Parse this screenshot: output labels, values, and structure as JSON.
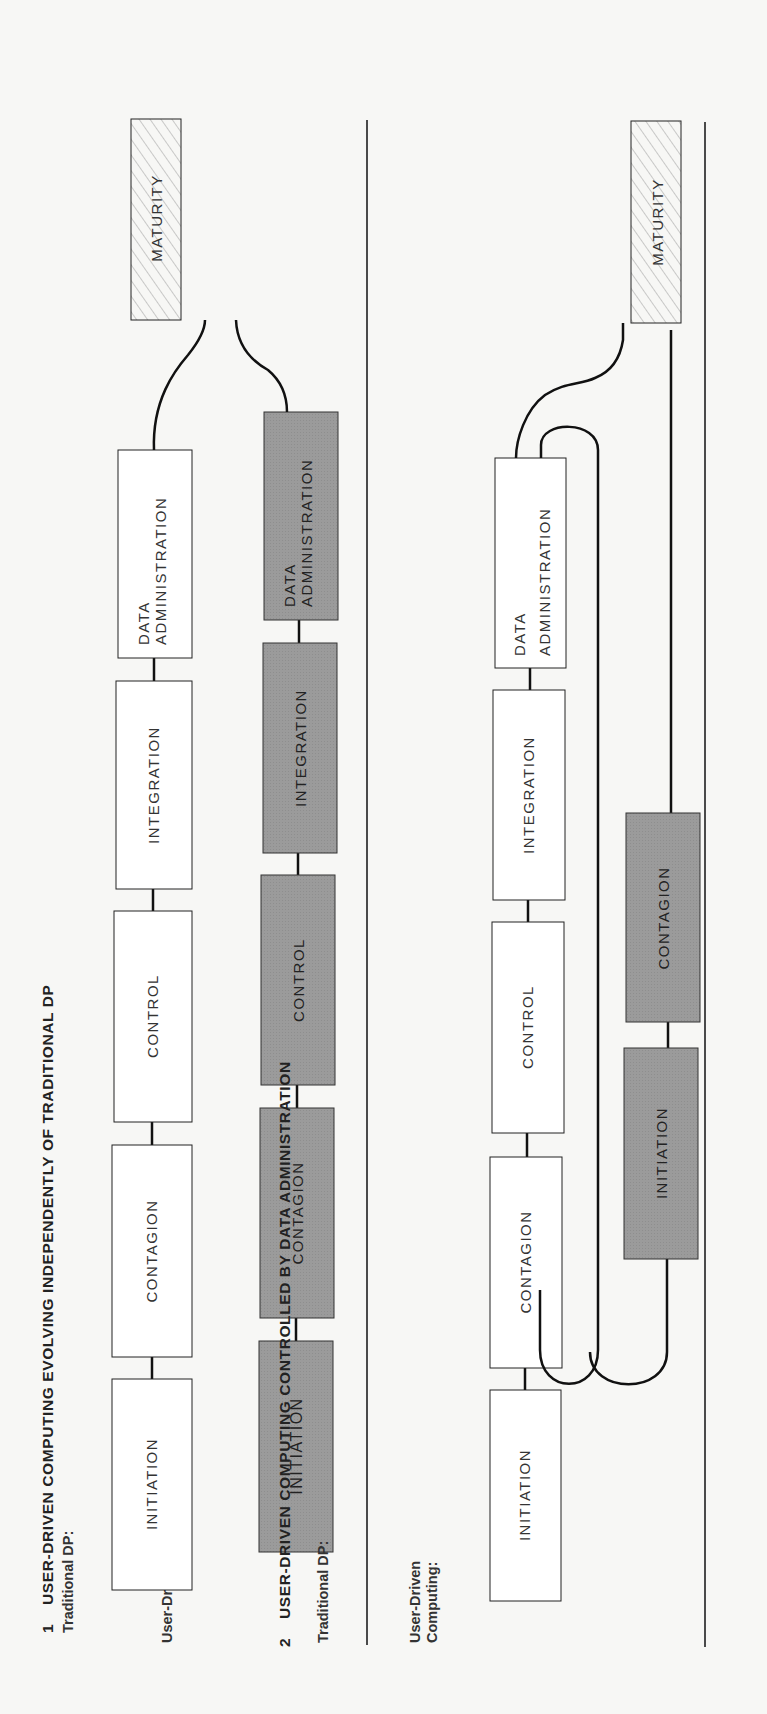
{
  "figure": {
    "orientation": "rotated-90-ccw",
    "colors": {
      "background": "#f7f7f5",
      "traditional_box_fill": "#ffffff",
      "user_driven_box_fill": "#9a9a9a",
      "maturity_hatch": "#9a9a9a",
      "line": "#111111"
    }
  },
  "diagram1": {
    "number": "1",
    "title": "USER-DRIVEN COMPUTING EVOLVING INDEPENDENTLY OF TRADITIONAL DP",
    "traditional_label": "Traditional DP:",
    "user_driven_label": "User-Driven Computing:",
    "traditional_stages": [
      "INITIATION",
      "CONTAGION",
      "CONTROL",
      "INTEGRATION",
      "DATA",
      "ADMINISTRATION"
    ],
    "user_stages": [
      "INITIATION",
      "CONTAGION",
      "CONTROL",
      "INTEGRATION",
      "DATA",
      "ADMINISTRATION"
    ],
    "maturity": "MATURITY"
  },
  "diagram2": {
    "number": "2",
    "title": "USER-DRIVEN COMPUTING CONTROLLED BY DATA ADMINISTRATION",
    "traditional_label": "Traditional DP:",
    "user_driven_label_line1": "User-Driven",
    "user_driven_label_line2": "Computing:",
    "traditional_stages": [
      "INITIATION",
      "CONTAGION",
      "CONTROL",
      "INTEGRATION",
      "DATA",
      "ADMINISTRATION"
    ],
    "user_stages": [
      "INITIATION",
      "CONTAGION"
    ],
    "maturity": "MATURITY"
  }
}
